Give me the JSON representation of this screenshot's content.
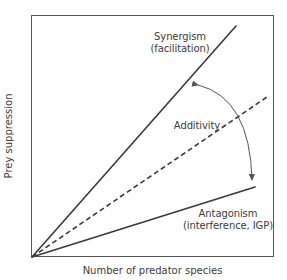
{
  "diagram": {
    "type": "conceptual-line-diagram",
    "axes": {
      "x_label": "Number of predator species",
      "y_label": "Prey suppression"
    },
    "lines": [
      {
        "id": "synergism",
        "label_line1": "Synergism",
        "label_line2": "(facilitation)",
        "style": "solid",
        "color": "#3a3a3a"
      },
      {
        "id": "additivity",
        "label": "Additivity",
        "style": "dashed",
        "color": "#3a3a3a"
      },
      {
        "id": "antagonism",
        "label_line1": "Antagonism",
        "label_line2": "(interference, IGP)",
        "style": "solid",
        "color": "#3a3a3a"
      }
    ],
    "arrow": {
      "type": "double-headed-curved-arrow",
      "connects": [
        "synergism",
        "antagonism"
      ],
      "color": "#555555"
    },
    "colors": {
      "frame": "#555555",
      "text": "#3c3c3c",
      "background": "#ffffff"
    }
  }
}
